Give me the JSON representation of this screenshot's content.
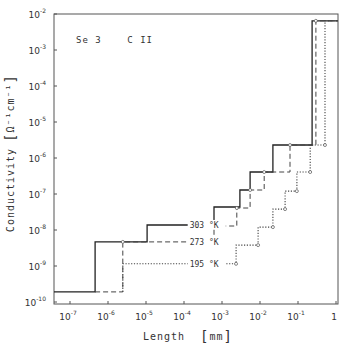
{
  "chart_data": {
    "type": "line",
    "subtype": "step",
    "title": "",
    "annotation": "Se 3    C II",
    "xlabel": "Length",
    "xlabel_unit": "mm",
    "ylabel": "Conductivity",
    "ylabel_unit": "Ω⁻¹cm⁻¹",
    "xscale": "log",
    "yscale": "log",
    "xlim_log10": [
      -7.42,
      0.05
    ],
    "ylim_log10": [
      -10,
      -2
    ],
    "x_ticks": [
      {
        "base": "10",
        "exp": "-7",
        "log": -7
      },
      {
        "base": "10",
        "exp": "-6",
        "log": -6
      },
      {
        "base": "10",
        "exp": "-5",
        "log": -5
      },
      {
        "base": "10",
        "exp": "-4",
        "log": -4
      },
      {
        "base": "10",
        "exp": "-3",
        "log": -3
      },
      {
        "base": "10",
        "exp": "-2",
        "log": -2
      },
      {
        "base": "10",
        "exp": "-1",
        "log": -1
      },
      {
        "base": "1",
        "exp": "",
        "log": 0
      }
    ],
    "y_ticks": [
      {
        "base": "10",
        "exp": "-2",
        "log": -2
      },
      {
        "base": "10",
        "exp": "-3",
        "log": -3
      },
      {
        "base": "10",
        "exp": "-4",
        "log": -4
      },
      {
        "base": "10",
        "exp": "-5",
        "log": -5
      },
      {
        "base": "10",
        "exp": "-6",
        "log": -6
      },
      {
        "base": "10",
        "exp": "-7",
        "log": -7
      },
      {
        "base": "10",
        "exp": "-8",
        "log": -8
      },
      {
        "base": "10",
        "exp": "-9",
        "log": -9
      },
      {
        "base": "10",
        "exp": "-10",
        "log": -10
      }
    ],
    "grid": false,
    "legend": "inline labels on curves",
    "series": [
      {
        "name": "303 °K",
        "style": "solid",
        "points_log10": [
          [
            -7.42,
            -9.72
          ],
          [
            -6.34,
            -9.72
          ],
          [
            -6.34,
            -8.33
          ],
          [
            -4.97,
            -8.33
          ],
          [
            -4.97,
            -7.86
          ],
          [
            -3.21,
            -7.86
          ],
          [
            -3.21,
            -7.36
          ],
          [
            -2.53,
            -7.36
          ],
          [
            -2.53,
            -6.89
          ],
          [
            -2.26,
            -6.89
          ],
          [
            -2.26,
            -6.39
          ],
          [
            -1.66,
            -6.39
          ],
          [
            -1.66,
            -5.64
          ],
          [
            -0.63,
            -5.64
          ],
          [
            -0.63,
            -2.19
          ],
          [
            0.05,
            -2.19
          ]
        ]
      },
      {
        "name": "273 °K",
        "style": "dashed",
        "points_log10": [
          [
            -6.34,
            -9.72
          ],
          [
            -5.61,
            -9.72
          ],
          [
            -5.61,
            -8.33
          ],
          [
            -3.21,
            -8.33
          ],
          [
            -3.21,
            -7.89
          ],
          [
            -2.61,
            -7.89
          ],
          [
            -2.61,
            -7.39
          ],
          [
            -2.26,
            -7.39
          ],
          [
            -2.26,
            -6.89
          ],
          [
            -1.89,
            -6.89
          ],
          [
            -1.89,
            -6.39
          ],
          [
            -1.21,
            -6.39
          ],
          [
            -1.21,
            -5.64
          ],
          [
            -0.53,
            -5.64
          ],
          [
            -0.53,
            -2.19
          ],
          [
            0.05,
            -2.19
          ]
        ]
      },
      {
        "name": "195 °K",
        "style": "dotted",
        "points_log10": [
          [
            -5.61,
            -9.72
          ],
          [
            -5.61,
            -8.94
          ],
          [
            -2.63,
            -8.94
          ],
          [
            -2.63,
            -8.42
          ],
          [
            -2.05,
            -8.42
          ],
          [
            -2.05,
            -7.92
          ],
          [
            -1.66,
            -7.92
          ],
          [
            -1.66,
            -7.42
          ],
          [
            -1.34,
            -7.42
          ],
          [
            -1.34,
            -6.92
          ],
          [
            -1.03,
            -6.92
          ],
          [
            -1.03,
            -6.39
          ],
          [
            -0.68,
            -6.39
          ],
          [
            -0.68,
            -5.64
          ],
          [
            -0.29,
            -5.64
          ],
          [
            -0.29,
            -2.19
          ],
          [
            0.05,
            -2.19
          ]
        ]
      }
    ],
    "labels": [
      {
        "text": "303 °K",
        "x_log10": -3.85,
        "y_log10": -7.86
      },
      {
        "text": "273 °K",
        "x_log10": -3.85,
        "y_log10": -8.33
      },
      {
        "text": "195 °K",
        "x_log10": -3.85,
        "y_log10": -8.94
      }
    ],
    "pixel_map": {
      "x0": 70,
      "px_per_decade_x": 38,
      "y0": 14,
      "px_per_decade_y": 36,
      "y0_log": -2,
      "x0_log": -7
    }
  }
}
